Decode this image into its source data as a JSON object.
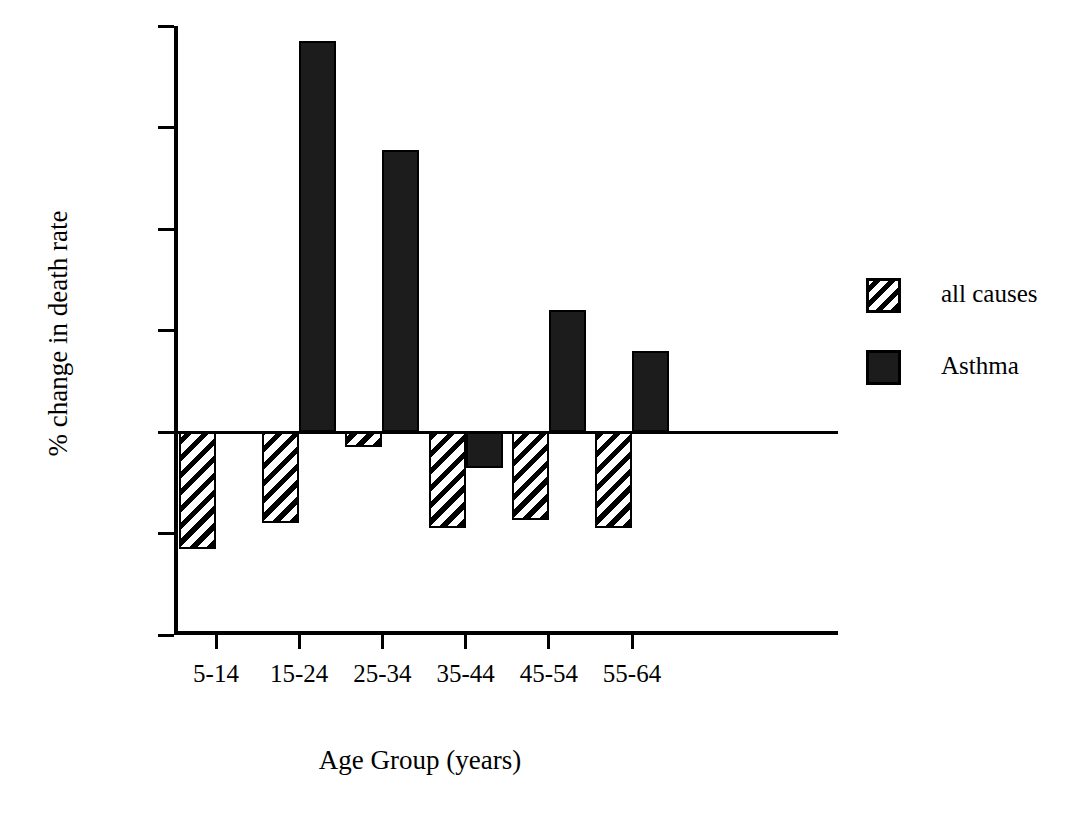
{
  "chart_data": {
    "type": "bar",
    "title": "",
    "xlabel": "Age Group (years)",
    "ylabel": "% change in death rate",
    "categories": [
      "5-14",
      "15-24",
      "25-34",
      "35-44",
      "45-54",
      "55-64"
    ],
    "ylim": [
      -20,
      40
    ],
    "yticks": [
      -20,
      -10,
      0,
      10,
      20,
      30,
      40
    ],
    "ytick_labels": [
      "-20",
      "-10",
      "0",
      "10",
      "20",
      "30",
      "40"
    ],
    "grid": false,
    "legend_position": "right",
    "series": [
      {
        "name": "all causes",
        "fill": "diagonal-hatch",
        "color": "#000000",
        "values": [
          -11.5,
          -9.0,
          -1.5,
          -9.5,
          -8.7,
          -9.5
        ]
      },
      {
        "name": "Asthma",
        "fill": "solid",
        "color": "#1c1c1c",
        "values": [
          null,
          38.5,
          27.8,
          -3.5,
          12.0,
          8.0
        ]
      }
    ]
  },
  "legend": {
    "items": [
      {
        "label": "all causes",
        "swatch": "hatch"
      },
      {
        "label": "Asthma",
        "swatch": "solid"
      }
    ]
  },
  "axes": {
    "x_title": "Age Group (years)",
    "y_title": "% change in death rate"
  }
}
